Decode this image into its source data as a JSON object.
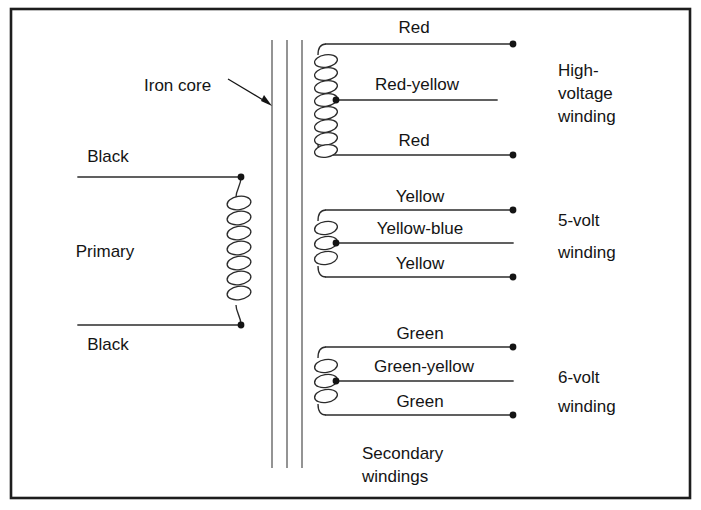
{
  "figure": {
    "frame": {
      "color": "#1d1d1d"
    }
  },
  "labels": {
    "iron_core": "Iron core",
    "primary": "Primary",
    "secondary_windings_line1": "Secondary",
    "secondary_windings_line2": "windings"
  },
  "primary_winding": {
    "name": "Primary",
    "lead_top": "Black",
    "lead_bottom": "Black",
    "turns": 7,
    "terminals": 2
  },
  "secondary_windings": [
    {
      "id": "high-voltage",
      "label_lines": [
        "High-",
        "voltage",
        "winding"
      ],
      "lead_top": "Red",
      "lead_center_tap": "Red-yellow",
      "lead_bottom": "Red",
      "turns": 8,
      "center_tapped": true
    },
    {
      "id": "5-volt",
      "label_lines": [
        "5-volt",
        "winding"
      ],
      "lead_top": "Yellow",
      "lead_center_tap": "Yellow-blue",
      "lead_bottom": "Yellow",
      "turns": 3,
      "center_tapped": true
    },
    {
      "id": "6-volt",
      "label_lines": [
        "6-volt",
        "winding"
      ],
      "lead_top": "Green",
      "lead_center_tap": "Green-yellow",
      "lead_bottom": "Green",
      "turns": 3,
      "center_tapped": true
    }
  ],
  "core": {
    "name": "Iron core",
    "laminations": 3
  }
}
